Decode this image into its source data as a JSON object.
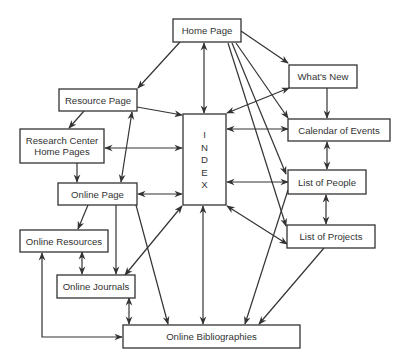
{
  "diagram": {
    "type": "site-map",
    "nodes": [
      {
        "id": "home",
        "label": [
          "Home Page"
        ]
      },
      {
        "id": "whatsnew",
        "label": [
          "What's New"
        ]
      },
      {
        "id": "calendar",
        "label": [
          "Calendar of Events"
        ]
      },
      {
        "id": "people",
        "label": [
          "List of People"
        ]
      },
      {
        "id": "projects",
        "label": [
          "List of Projects"
        ]
      },
      {
        "id": "index",
        "label": [
          "I",
          "N",
          "D",
          "E",
          "X"
        ]
      },
      {
        "id": "resource",
        "label": [
          "Resource Page"
        ]
      },
      {
        "id": "research",
        "label": [
          "Research Center",
          "Home Pages"
        ]
      },
      {
        "id": "online",
        "label": [
          "Online Page"
        ]
      },
      {
        "id": "onlineres",
        "label": [
          "Online Resources"
        ]
      },
      {
        "id": "journals",
        "label": [
          "Online Journals"
        ]
      },
      {
        "id": "biblio",
        "label": [
          "Online Bibliographies"
        ]
      }
    ],
    "edges": [
      {
        "from": "home",
        "to": "resource",
        "dir": "forward"
      },
      {
        "from": "home",
        "to": "index",
        "dir": "both"
      },
      {
        "from": "home",
        "to": "whatsnew",
        "dir": "forward"
      },
      {
        "from": "home",
        "to": "calendar",
        "dir": "forward"
      },
      {
        "from": "home",
        "to": "people",
        "dir": "forward"
      },
      {
        "from": "home",
        "to": "projects",
        "dir": "forward"
      },
      {
        "from": "whatsnew",
        "to": "index",
        "dir": "both"
      },
      {
        "from": "whatsnew",
        "to": "calendar",
        "dir": "forward"
      },
      {
        "from": "calendar",
        "to": "index",
        "dir": "both"
      },
      {
        "from": "calendar",
        "to": "people",
        "dir": "both"
      },
      {
        "from": "people",
        "to": "index",
        "dir": "both"
      },
      {
        "from": "people",
        "to": "projects",
        "dir": "both"
      },
      {
        "from": "people",
        "to": "biblio",
        "dir": "forward"
      },
      {
        "from": "projects",
        "to": "index",
        "dir": "both"
      },
      {
        "from": "projects",
        "to": "biblio",
        "dir": "forward"
      },
      {
        "from": "resource",
        "to": "index",
        "dir": "forward"
      },
      {
        "from": "resource",
        "to": "research",
        "dir": "forward"
      },
      {
        "from": "resource",
        "to": "online",
        "dir": "both"
      },
      {
        "from": "research",
        "to": "index",
        "dir": "both"
      },
      {
        "from": "research",
        "to": "online",
        "dir": "forward"
      },
      {
        "from": "online",
        "to": "index",
        "dir": "both"
      },
      {
        "from": "online",
        "to": "onlineres",
        "dir": "forward"
      },
      {
        "from": "online",
        "to": "journals",
        "dir": "forward"
      },
      {
        "from": "online",
        "to": "biblio",
        "dir": "forward"
      },
      {
        "from": "onlineres",
        "to": "journals",
        "dir": "both"
      },
      {
        "from": "onlineres",
        "to": "biblio",
        "dir": "both"
      },
      {
        "from": "journals",
        "to": "index",
        "dir": "both"
      },
      {
        "from": "journals",
        "to": "biblio",
        "dir": "both"
      },
      {
        "from": "index",
        "to": "biblio",
        "dir": "both"
      }
    ]
  }
}
